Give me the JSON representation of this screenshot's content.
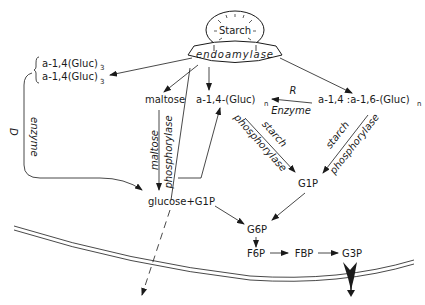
{
  "nodes": {
    "starch": "Starch",
    "endoamylase": "endoamylase",
    "gluc3_a": "a-1,4(Gluc)",
    "gluc3_b": "a-1,4(Gluc)",
    "sub3": "3",
    "maltose": "maltose",
    "a14n": "a-1,4-(Gluc)",
    "a14a16n": "a-1,4 :a-1,6-(Gluc)",
    "subn": "n",
    "glucose_g1p": "glucose+G1P",
    "g1p": "G1P",
    "g6p": "G6P",
    "f6p": "F6P",
    "fbp": "FBP",
    "g3p": "G3P"
  },
  "enzymes": {
    "d": "D",
    "d_enzyme": "enzyme",
    "r": "R",
    "r_enzyme": "Enzyme",
    "maltose_phos_1": "maltose",
    "maltose_phos_2": "phosphorylase",
    "starch_phos_left_1": "starch",
    "starch_phos_left_2": "phosphorylase",
    "starch_phos_right_1": "starch",
    "starch_phos_right_2": "phosphorylase"
  },
  "colors": {
    "ink": "#1a1a1a",
    "background": "#ffffff"
  }
}
